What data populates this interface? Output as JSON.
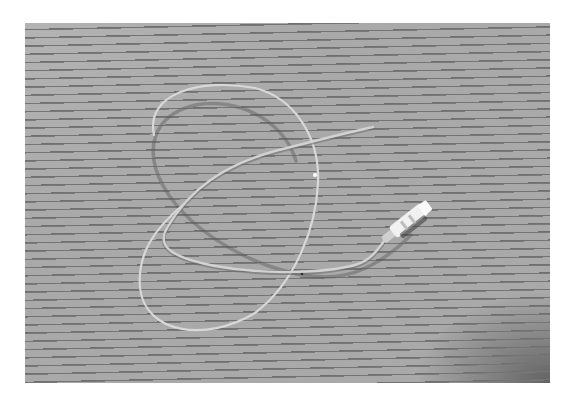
{
  "image": {
    "subject": "catheter tube with connector hub",
    "background": "horizontally striped surface",
    "colors": {
      "background": "#a9a9a9",
      "stripe": "#6e6e6e",
      "tube": "#dcdcdc",
      "tube_shadow": "#5a5a5a",
      "hub": "#f2f2f2",
      "page": "#ffffff"
    }
  }
}
